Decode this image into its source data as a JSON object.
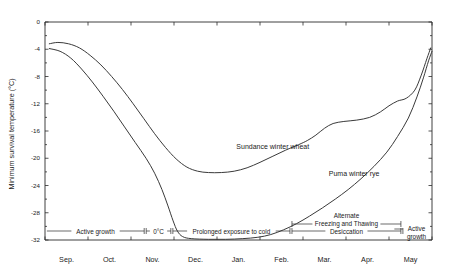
{
  "chart_data": {
    "type": "line",
    "title": "",
    "xlabel": "",
    "ylabel": "Minimum survival temperature (°C)",
    "ylim": [
      -32,
      0
    ],
    "xlim": [
      0,
      9
    ],
    "grid": false,
    "legend_position": "inline-labels",
    "ytick_labels": [
      "0",
      "-4",
      "-8",
      "-12",
      "-16",
      "-20",
      "-24",
      "-28",
      "-32"
    ],
    "ytick_values": [
      0,
      -4,
      -8,
      -12,
      -16,
      -20,
      -24,
      -28,
      -32
    ],
    "categories": [
      "Sep.",
      "Oct.",
      "Nov.",
      "Dec.",
      "Jan.",
      "Feb.",
      "Mar.",
      "Apr.",
      "May"
    ],
    "xtick_centers": [
      0.5,
      1.5,
      2.5,
      3.5,
      4.5,
      5.5,
      6.5,
      7.5,
      8.5
    ],
    "series": [
      {
        "name": "Sundance winter wheat",
        "label_x": 4.45,
        "label_y": -18.6,
        "points": [
          [
            0.1,
            -3.2
          ],
          [
            0.3,
            -3.0
          ],
          [
            0.55,
            -3.2
          ],
          [
            0.8,
            -3.8
          ],
          [
            1.05,
            -4.9
          ],
          [
            1.3,
            -6.3
          ],
          [
            1.55,
            -8.0
          ],
          [
            1.8,
            -9.9
          ],
          [
            2.05,
            -12.0
          ],
          [
            2.3,
            -14.2
          ],
          [
            2.55,
            -16.4
          ],
          [
            2.8,
            -18.4
          ],
          [
            3.05,
            -20.1
          ],
          [
            3.3,
            -21.3
          ],
          [
            3.55,
            -21.9
          ],
          [
            3.8,
            -22.1
          ],
          [
            4.1,
            -22.1
          ],
          [
            4.4,
            -21.9
          ],
          [
            4.7,
            -21.4
          ],
          [
            5.0,
            -20.6
          ],
          [
            5.3,
            -19.7
          ],
          [
            5.6,
            -18.8
          ],
          [
            5.9,
            -18.0
          ],
          [
            6.1,
            -17.4
          ],
          [
            6.3,
            -16.6
          ],
          [
            6.5,
            -15.6
          ],
          [
            6.7,
            -14.9
          ],
          [
            6.95,
            -14.6
          ],
          [
            7.25,
            -14.4
          ],
          [
            7.55,
            -14.0
          ],
          [
            7.8,
            -13.2
          ],
          [
            8.0,
            -12.3
          ],
          [
            8.2,
            -11.6
          ],
          [
            8.4,
            -11.2
          ],
          [
            8.6,
            -10.0
          ],
          [
            8.75,
            -7.8
          ],
          [
            8.88,
            -5.4
          ],
          [
            8.97,
            -3.8
          ]
        ]
      },
      {
        "name": "Puma winter rye",
        "label_x": 6.6,
        "label_y": -22.6,
        "points": [
          [
            0.1,
            -3.9
          ],
          [
            0.35,
            -4.3
          ],
          [
            0.6,
            -5.3
          ],
          [
            0.85,
            -6.9
          ],
          [
            1.1,
            -8.8
          ],
          [
            1.35,
            -10.9
          ],
          [
            1.6,
            -13.1
          ],
          [
            1.85,
            -15.4
          ],
          [
            2.1,
            -17.7
          ],
          [
            2.35,
            -20.0
          ],
          [
            2.55,
            -22.2
          ],
          [
            2.72,
            -24.6
          ],
          [
            2.86,
            -27.0
          ],
          [
            2.98,
            -29.2
          ],
          [
            3.08,
            -30.7
          ],
          [
            3.2,
            -31.5
          ],
          [
            3.4,
            -31.8
          ],
          [
            3.8,
            -31.9
          ],
          [
            4.2,
            -31.9
          ],
          [
            4.6,
            -31.8
          ],
          [
            4.95,
            -31.6
          ],
          [
            5.25,
            -31.2
          ],
          [
            5.55,
            -30.5
          ],
          [
            5.85,
            -29.6
          ],
          [
            6.15,
            -28.5
          ],
          [
            6.45,
            -27.3
          ],
          [
            6.75,
            -26.0
          ],
          [
            7.05,
            -24.6
          ],
          [
            7.35,
            -23.0
          ],
          [
            7.65,
            -21.2
          ],
          [
            7.95,
            -19.1
          ],
          [
            8.2,
            -16.8
          ],
          [
            8.45,
            -14.1
          ],
          [
            8.65,
            -11.0
          ],
          [
            8.8,
            -8.2
          ],
          [
            8.92,
            -5.7
          ],
          [
            9.0,
            -4.3
          ]
        ]
      }
    ],
    "annotations": {
      "phase_bar": [
        {
          "label": "Active growth",
          "x_start": 0.02,
          "x_end": 2.33,
          "arrow_left": false,
          "arrow_right": true
        },
        {
          "label": "0°C",
          "x_start": 2.33,
          "x_end": 2.95,
          "arrow_left": true,
          "arrow_right": true
        },
        {
          "label": "Prolonged exposure to cold",
          "x_start": 2.95,
          "x_end": 5.72,
          "arrow_left": true,
          "arrow_right": true
        },
        {
          "label": "Desiccation",
          "x_start": 5.72,
          "x_end": 8.3,
          "arrow_left": true,
          "arrow_right": true
        },
        {
          "label": "Active growth",
          "x_start": 8.3,
          "x_end": 8.98,
          "arrow_left": true,
          "arrow_right": false
        }
      ],
      "upper_bar": {
        "line1": "Alternate",
        "line2": "Freezing and Thawing",
        "x_start": 5.72,
        "x_end": 8.3
      }
    }
  }
}
